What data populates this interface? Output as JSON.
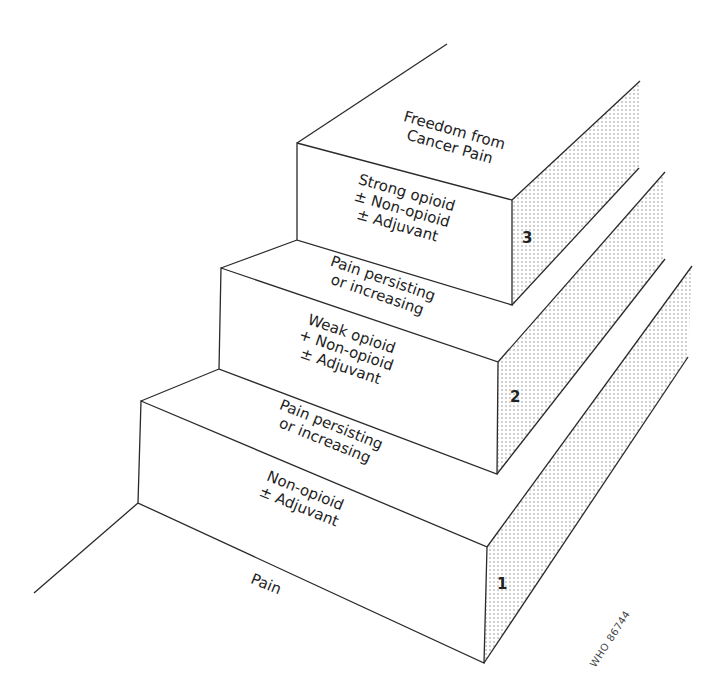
{
  "diagram": {
    "type": "three-step analgesic ladder",
    "colors": {
      "line": "#2a2a2a",
      "shade_dot": "#8a8a8a",
      "background": "#ffffff"
    },
    "top_label": {
      "lines": [
        "Freedom from",
        "Cancer Pain"
      ]
    },
    "steps": [
      {
        "number": "1",
        "treatment": [
          "Non-opioid",
          "± Adjuvant"
        ],
        "riser_label": [
          "Pain persisting",
          "or increasing"
        ]
      },
      {
        "number": "2",
        "treatment": [
          "Weak opioid",
          "+ Non-opioid",
          "± Adjuvant"
        ],
        "riser_label": [
          "Pain persisting",
          "or increasing"
        ]
      },
      {
        "number": "3",
        "treatment": [
          "Strong opioid",
          "± Non-opioid",
          "± Adjuvant"
        ]
      }
    ],
    "ground_label": "Pain",
    "figure_code": "WHO 86744"
  }
}
